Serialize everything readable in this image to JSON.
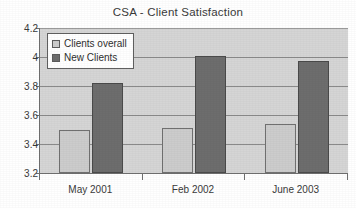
{
  "chart_data": {
    "type": "bar",
    "title": "CSA - Client Satisfaction",
    "xlabel": "",
    "ylabel": "",
    "categories": [
      "May 2001",
      "Feb 2002",
      "June 2003"
    ],
    "series": [
      {
        "name": "Clients overall",
        "values": [
          3.5,
          3.51,
          3.54
        ],
        "color": "#cccccc"
      },
      {
        "name": "New Clients",
        "values": [
          3.82,
          4.01,
          3.97
        ],
        "color": "#6d6d6d"
      }
    ],
    "ylim": [
      3.2,
      4.2
    ],
    "yticks": [
      3.2,
      3.4,
      3.6,
      3.8,
      4.0,
      4.2
    ],
    "ytick_labels": [
      "3.2",
      "3.4",
      "3.6",
      "3.8",
      "4",
      "4.2"
    ],
    "grid": true,
    "legend_position": "top-left-inside",
    "plot_background": "#d5d5d5"
  },
  "legend": {
    "entries": [
      {
        "label": "Clients overall"
      },
      {
        "label": "New Clients"
      }
    ]
  }
}
